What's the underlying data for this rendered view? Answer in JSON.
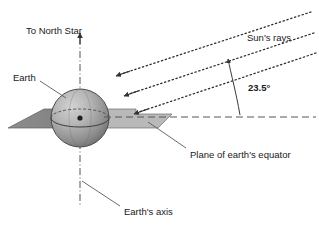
{
  "diagram": {
    "labels": {
      "north_star": "To North Star",
      "earth": "Earth",
      "suns_rays": "Sun's rays",
      "angle": "23.5°",
      "equator_plane": "Plane of earth's equator",
      "earth_axis": "Earth's axis"
    },
    "values": {
      "tilt_degrees": "23.5",
      "ray_count": "3"
    },
    "colors": {
      "background": "#ffffff",
      "stroke": "#4d4d4d",
      "text": "#1a1a1a",
      "plane_left": "#808080",
      "plane_right": "#b3b3b3",
      "sphere_light": "#c8c8c8",
      "sphere_dark": "#6e6e6e",
      "dash_line": "#555555"
    }
  }
}
